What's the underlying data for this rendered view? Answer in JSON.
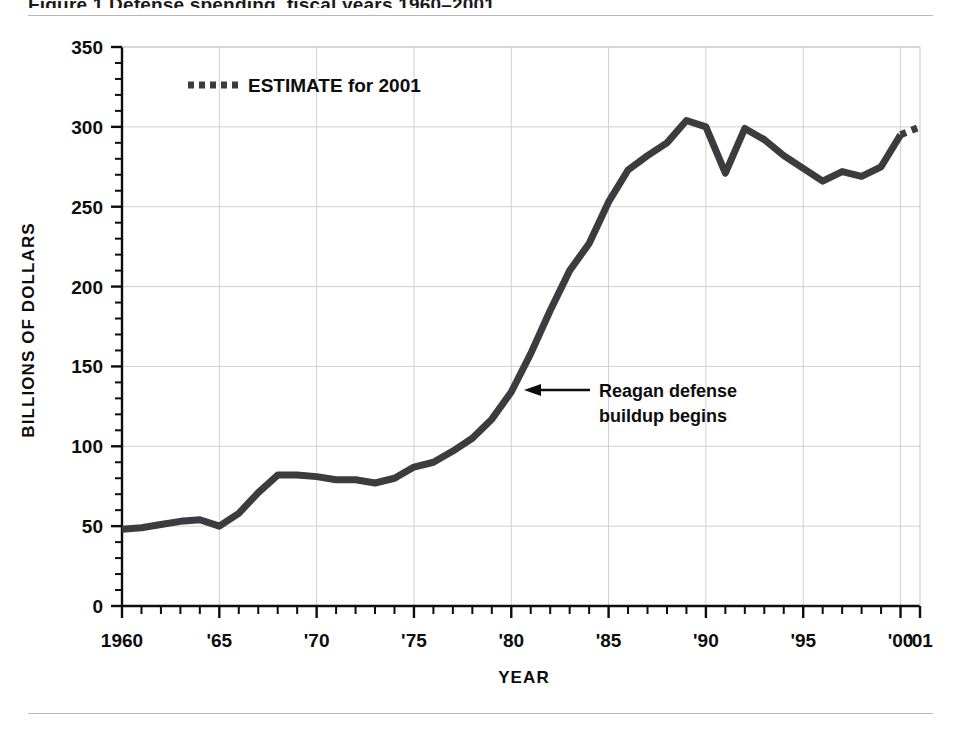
{
  "figure": {
    "title_fragment": "Figure 1  Defense spending, fiscal years 1960–2001",
    "top_rule": true,
    "bottom_rule": true
  },
  "legend": {
    "position": "top-left-inside",
    "entries": [
      {
        "label": "ESTIMATE for 2001",
        "marker": "dotted-line",
        "color": "#3b3b40"
      }
    ]
  },
  "annotation": {
    "line1": "Reagan defense",
    "line2": "buildup begins",
    "arrow": "left-arrow-icon",
    "points_to_year": 1981,
    "points_to_value": 137
  },
  "chart_data": {
    "type": "line",
    "title": "Defense spending",
    "xlabel": "YEAR",
    "ylabel": "BILLIONS OF DOLLARS",
    "xlim": [
      1960,
      2001
    ],
    "ylim": [
      0,
      350
    ],
    "ytick_step": 50,
    "yminor_step": 10,
    "xtick_step": 1,
    "xlabel_step": 5,
    "grid": "both",
    "grid_color": "#d0d0d4",
    "line_color": "#3b3b40",
    "line_width": 7,
    "ytick_labels": [
      "0",
      "50",
      "100",
      "150",
      "200",
      "250",
      "300",
      "350"
    ],
    "ytick_values": [
      0,
      50,
      100,
      150,
      200,
      250,
      300,
      350
    ],
    "xtick_labels": [
      "1960",
      "'65",
      "'70",
      "'75",
      "'80",
      "'85",
      "'90",
      "'95",
      "'00",
      "'01"
    ],
    "xtick_label_years": [
      1960,
      1965,
      1970,
      1975,
      1980,
      1985,
      1990,
      1995,
      2000,
      2001
    ],
    "series": [
      {
        "name": "Defense spending (actual)",
        "style": "solid",
        "x": [
          1960,
          1961,
          1962,
          1963,
          1964,
          1965,
          1966,
          1967,
          1968,
          1969,
          1970,
          1971,
          1972,
          1973,
          1974,
          1975,
          1976,
          1977,
          1978,
          1979,
          1980,
          1981,
          1982,
          1983,
          1984,
          1985,
          1986,
          1987,
          1988,
          1989,
          1990,
          1991,
          1992,
          1993,
          1994,
          1995,
          1996,
          1997,
          1998,
          1999,
          2000
        ],
        "values": [
          48,
          49,
          51,
          53,
          54,
          50,
          58,
          71,
          82,
          82,
          81,
          79,
          79,
          77,
          80,
          87,
          90,
          97,
          105,
          117,
          134,
          158,
          185,
          210,
          227,
          253,
          273,
          282,
          290,
          304,
          300,
          271,
          299,
          292,
          282,
          274,
          266,
          272,
          269,
          275,
          295
        ]
      },
      {
        "name": "Defense spending (2001 estimate)",
        "style": "dotted",
        "x": [
          2000,
          2001
        ],
        "values": [
          295,
          300
        ]
      }
    ],
    "notable_points": [
      {
        "year": 1965,
        "value": 50,
        "note": "local dip"
      },
      {
        "year": 1968,
        "value": 82,
        "note": "Vietnam plateau"
      },
      {
        "year": 1981,
        "value": 158,
        "note": "Reagan defense buildup begins"
      },
      {
        "year": 1989,
        "value": 304,
        "note": "Cold War peak"
      },
      {
        "year": 1991,
        "value": 271,
        "note": "post-Gulf War trough"
      },
      {
        "year": 1992,
        "value": 299,
        "note": "rebound"
      },
      {
        "year": 1998,
        "value": 269,
        "note": "post-Cold War low"
      },
      {
        "year": 2001,
        "value": 300,
        "note": "estimate"
      }
    ]
  }
}
